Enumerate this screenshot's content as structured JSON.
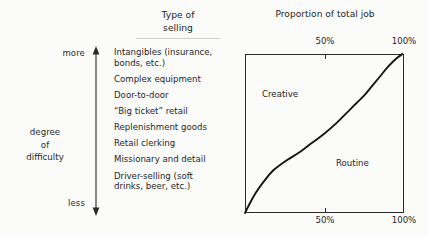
{
  "figure": {
    "title_left": "Type of\nselling",
    "title_right": "Proportion of total job"
  },
  "difficulty_axis": {
    "top_label": "more",
    "bottom_label": "less",
    "axis_label": "degree\nof\ndifficulty",
    "arrow_icon": "double-headed-vertical-arrow-icon"
  },
  "selling_types": [
    {
      "text": "Intangibles (insurance,\n   bonds, etc.)"
    },
    {
      "text": "Complex equipment"
    },
    {
      "text": "Door-to-door"
    },
    {
      "text": "“Big ticket” retail"
    },
    {
      "text": "Replenishment goods"
    },
    {
      "text": "Retail clerking"
    },
    {
      "text": "Missionary and detail"
    },
    {
      "text": "Driver-selling (soft\n   drinks, beer, etc.)"
    }
  ],
  "chart_data": {
    "type": "line",
    "title": "Proportion of total job",
    "xlabel": "",
    "ylabel": "degree of difficulty",
    "xlim": [
      0,
      100
    ],
    "ylim": [
      0,
      100
    ],
    "grid": false,
    "legend": "none",
    "top_axis": {
      "ticks": [
        50,
        100
      ],
      "tick_labels": [
        "50%",
        "100%"
      ]
    },
    "bottom_axis": {
      "ticks": [
        50,
        100
      ],
      "tick_labels": [
        "50%",
        "100%"
      ]
    },
    "regions": [
      {
        "name": "Creative",
        "label": "Creative",
        "side": "left-of-curve"
      },
      {
        "name": "Routine",
        "label": "Routine",
        "side": "right-of-curve"
      }
    ],
    "series": [
      {
        "name": "creative-routine-boundary",
        "x": [
          0,
          3,
          7,
          12,
          18,
          26,
          34,
          42,
          50,
          58,
          64,
          70,
          75,
          80,
          85,
          90,
          95,
          99
        ],
        "y": [
          0,
          6,
          13,
          20,
          27,
          33,
          38,
          44,
          50,
          57,
          63,
          69,
          74,
          80,
          86,
          92,
          97,
          100
        ]
      }
    ]
  },
  "colors": {
    "ink": "#1c1c1c",
    "line": "#2b2b2b",
    "paper": "#fbfbfa",
    "rule": "#cfcfcb"
  }
}
